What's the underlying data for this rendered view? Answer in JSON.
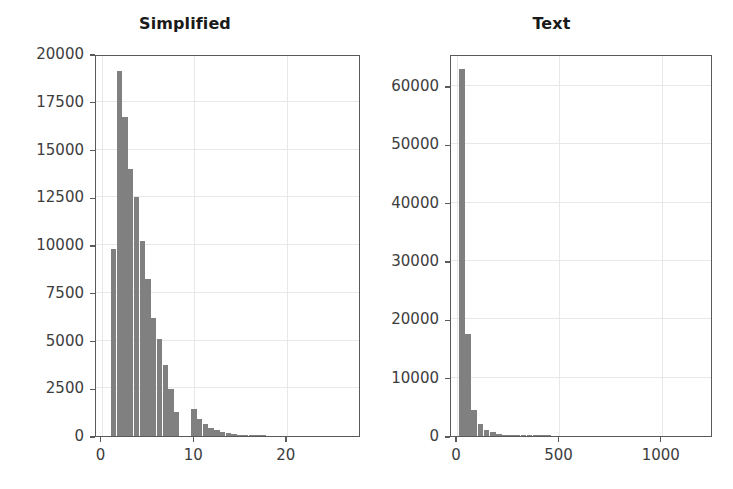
{
  "figure": {
    "background": "#ffffff",
    "bar_color": "#808080",
    "axis_color": "#5a5a5a",
    "grid_color": "#e8e8e8",
    "text_color": "#3d3d3d",
    "title_color": "#1a1a1a"
  },
  "chart_data": [
    {
      "type": "bar",
      "id": "simplified",
      "title": "Simplified",
      "xlabel": "",
      "ylabel": "",
      "grid": true,
      "legend": "none",
      "xlim": [
        -0.6,
        28.0
      ],
      "ylim": [
        0,
        20000
      ],
      "xticks": [
        0,
        10,
        20
      ],
      "xtick_labels": [
        "0",
        "10",
        "20"
      ],
      "yticks": [
        0,
        2500,
        5000,
        7500,
        10000,
        12500,
        15000,
        17500,
        20000
      ],
      "ytick_labels": [
        "0",
        "2500",
        "5000",
        "7500",
        "10000",
        "12500",
        "15000",
        "17500",
        "20000"
      ],
      "bin_width": 0.62,
      "bin_starts": [
        1.0,
        1.62,
        2.24,
        2.86,
        3.48,
        4.1,
        4.72,
        5.34,
        5.96,
        6.58,
        7.2,
        7.82,
        8.44,
        9.06,
        9.68,
        10.3,
        10.92,
        11.54,
        12.16,
        12.78,
        13.4,
        14.02,
        14.64,
        15.26,
        15.88,
        16.5,
        17.12
      ],
      "values": [
        9800,
        19100,
        16700,
        14000,
        12500,
        10200,
        8200,
        6200,
        5100,
        3700,
        2450,
        1250,
        0,
        0,
        1400,
        900,
        620,
        430,
        300,
        200,
        140,
        95,
        60,
        40,
        25,
        15,
        8
      ]
    },
    {
      "type": "bar",
      "id": "text",
      "title": "Text",
      "xlabel": "",
      "ylabel": "",
      "grid": true,
      "legend": "none",
      "xlim": [
        -30,
        1250
      ],
      "ylim": [
        0,
        65500
      ],
      "xticks": [
        0,
        500,
        1000
      ],
      "xtick_labels": [
        "0",
        "500",
        "1000"
      ],
      "yticks": [
        0,
        10000,
        20000,
        30000,
        40000,
        50000,
        60000
      ],
      "ytick_labels": [
        "0",
        "10000",
        "20000",
        "30000",
        "40000",
        "50000",
        "60000"
      ],
      "bin_width": 30,
      "bin_starts": [
        10,
        40,
        70,
        100,
        130,
        160,
        190,
        220,
        250,
        280,
        310,
        340,
        370,
        400,
        430
      ],
      "values": [
        63000,
        17500,
        4500,
        2000,
        1100,
        620,
        380,
        220,
        140,
        90,
        60,
        40,
        25,
        15,
        8
      ]
    }
  ]
}
